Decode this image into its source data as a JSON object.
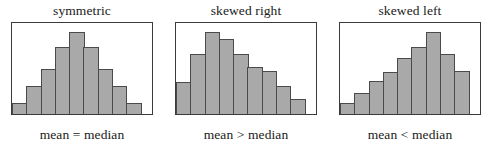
{
  "figure": {
    "background_color": "#ffffff",
    "bar_fill_color": "#a9a9a9",
    "bar_border_color": "#4a4a4a",
    "box_border_color": "#3a3a3a",
    "text_color": "#1a1a1a"
  },
  "panels": [
    {
      "title": "symmetric",
      "caption": "mean = median"
    },
    {
      "title": "skewed right",
      "caption": "mean > median"
    },
    {
      "title": "skewed left",
      "caption": "mean < median"
    }
  ],
  "chart_data": [
    {
      "type": "bar",
      "title": "symmetric",
      "annotation": "mean = median",
      "categories": [
        "1",
        "2",
        "3",
        "4",
        "5",
        "6",
        "7",
        "8",
        "9"
      ],
      "values": [
        1,
        2.6,
        4.2,
        6.2,
        7.6,
        6.2,
        4.2,
        2.6,
        1
      ],
      "xlabel": "",
      "ylabel": "",
      "ylim": [
        0,
        8.4
      ],
      "grid": false,
      "legend": "none",
      "bar_count": 9,
      "shape": "symmetric unimodal bell"
    },
    {
      "type": "bar",
      "title": "skewed right",
      "annotation": "mean > median",
      "categories": [
        "1",
        "2",
        "3",
        "4",
        "5",
        "6",
        "7",
        "8",
        "9"
      ],
      "values": [
        3.0,
        5.6,
        7.6,
        7.0,
        5.6,
        4.4,
        4.0,
        2.6,
        1.4
      ],
      "xlabel": "",
      "ylabel": "",
      "ylim": [
        0,
        8.4
      ],
      "grid": false,
      "legend": "none",
      "bar_count": 9,
      "shape": "right-skewed, long tail toward high values"
    },
    {
      "type": "bar",
      "title": "skewed left",
      "annotation": "mean < median",
      "categories": [
        "1",
        "2",
        "3",
        "4",
        "5",
        "6",
        "7",
        "8",
        "9"
      ],
      "values": [
        1.0,
        2.0,
        3.1,
        3.9,
        5.2,
        6.2,
        7.6,
        5.6,
        4.0
      ],
      "xlabel": "",
      "ylabel": "",
      "ylim": [
        0,
        8.4
      ],
      "grid": false,
      "legend": "none",
      "bar_count": 9,
      "shape": "left-skewed, long tail toward low values"
    }
  ]
}
